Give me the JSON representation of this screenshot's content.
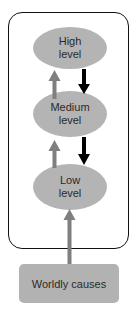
{
  "diagram": {
    "levels": [
      {
        "id": "high",
        "label": "High\nlevel"
      },
      {
        "id": "medium",
        "label": "Medium\nlevel"
      },
      {
        "id": "low",
        "label": "Low\nlevel"
      }
    ],
    "source": {
      "label": "Worldly causes"
    },
    "colors": {
      "node_fill": "#b4b4b4",
      "up_arrow": "#7f7f7f",
      "down_arrow": "#000000",
      "frame": "#111111"
    },
    "edges": [
      {
        "from": "worldly_causes",
        "to": "low",
        "color": "gray",
        "direction": "up"
      },
      {
        "from": "low",
        "to": "medium",
        "color": "gray",
        "direction": "up"
      },
      {
        "from": "medium",
        "to": "high",
        "color": "gray",
        "direction": "up"
      },
      {
        "from": "high",
        "to": "medium",
        "color": "black",
        "direction": "down"
      },
      {
        "from": "medium",
        "to": "low",
        "color": "black",
        "direction": "down"
      }
    ]
  }
}
